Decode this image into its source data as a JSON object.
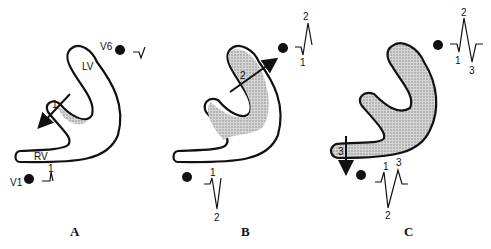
{
  "figure": {
    "panels": [
      {
        "id": "A",
        "label": "A",
        "chamber_labels": {
          "lv": "LV",
          "rv": "RV"
        },
        "leads": {
          "v6": "V6",
          "v1": "V1"
        },
        "vector_label": "1",
        "v1_wave_labels": [
          "1"
        ],
        "v6_wave_labels": []
      },
      {
        "id": "B",
        "label": "B",
        "vector_label": "2",
        "v6_wave_labels": [
          "2",
          "1"
        ],
        "v1_wave_labels": [
          "1",
          "2"
        ]
      },
      {
        "id": "C",
        "label": "C",
        "vector_label": "3",
        "v6_wave_labels": [
          "2",
          "1",
          "3"
        ],
        "v1_wave_labels": [
          "1",
          "3",
          "2"
        ]
      }
    ],
    "colors": {
      "stroke": "#111111",
      "shade": "#bdbdbd",
      "background": "#ffffff"
    }
  }
}
